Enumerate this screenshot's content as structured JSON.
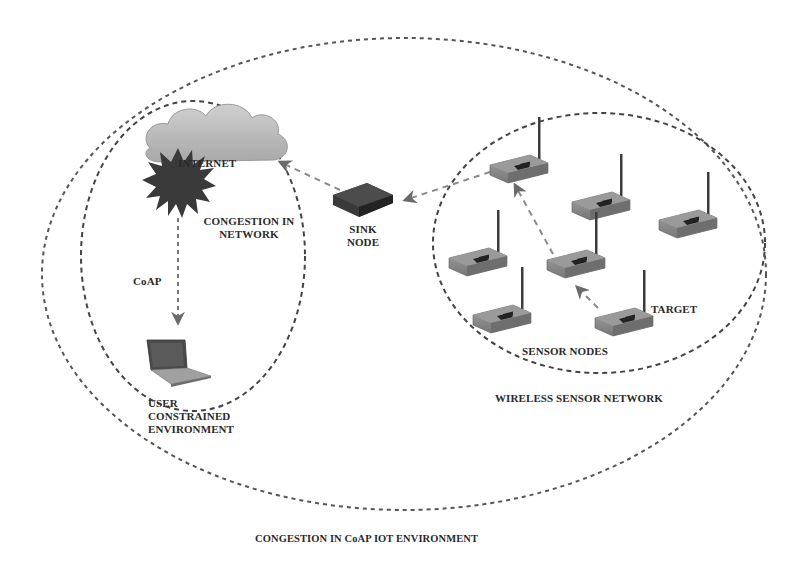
{
  "caption": "CONGESTION IN CoAP IOT ENVIRONMENT",
  "regions": {
    "outer": {
      "label": "CONGESTION IN CoAP IOT ENVIRONMENT"
    },
    "constrained": {
      "label_line1": "USER",
      "label_line2": "CONSTRAINED",
      "label_line3": "ENVIRONMENT"
    },
    "wsn": {
      "label": "WIRELESS SENSOR NETWORK"
    }
  },
  "nodes": {
    "internet": {
      "label": "INTERNET",
      "icon": "cloud-icon"
    },
    "congestion": {
      "label_line1": "CONGESTION IN",
      "label_line2": "NETWORK",
      "icon": "burst-icon"
    },
    "sink": {
      "label_line1": "SINK",
      "label_line2": "NODE",
      "icon": "router-icon"
    },
    "user": {
      "label": "USER",
      "icon": "laptop-icon"
    },
    "target": {
      "label": "TARGET"
    },
    "sensor_nodes": {
      "label": "SENSOR NODES",
      "count": 7,
      "icon": "wireless-router-icon"
    }
  },
  "edges": [
    {
      "from": "internet",
      "to": "user",
      "label": "CoAP"
    },
    {
      "from": "sink",
      "to": "internet",
      "label": ""
    },
    {
      "from": "sensor-top",
      "to": "sink",
      "label": ""
    },
    {
      "from": "sensor-middle",
      "to": "sensor-top",
      "label": ""
    },
    {
      "from": "target",
      "to": "sensor-middle",
      "label": ""
    }
  ],
  "colors": {
    "line": "#555555",
    "cloud": "#b5b5b5",
    "burst": "#3a3a3a",
    "device": "#8a8a8a",
    "text": "#2a2a2a"
  }
}
